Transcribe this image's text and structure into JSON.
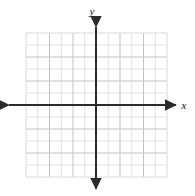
{
  "figure": {
    "name": "blank-cartesian-coordinate-grid",
    "background_color": "#ffffff",
    "width": 195,
    "height": 196
  },
  "axes": {
    "x_label": "x",
    "y_label": "y",
    "color": "#2b2b2b",
    "stroke_width": 2,
    "origin": {
      "x": 96,
      "y": 105
    },
    "x_start": {
      "x": 9,
      "y": 105
    },
    "x_end": {
      "x": 176,
      "y": 105
    },
    "y_start": {
      "x": 96,
      "y": 27
    },
    "y_end": {
      "x": 96,
      "y": 189
    },
    "arrowheads": [
      "left",
      "right",
      "up",
      "down"
    ],
    "x_label_pos": {
      "x": 184,
      "y": 109
    },
    "y_label_pos": {
      "x": 92,
      "y": 15
    }
  },
  "grid": {
    "left": 26,
    "top": 33,
    "right": 167,
    "bottom": 177,
    "columns": 12,
    "rows": 12,
    "cell_width": 11.75,
    "cell_height": 12.0,
    "minor_color": "#e2e2e4",
    "major_color": "#c3c3c7",
    "border_color": "#dadade",
    "major_every": 2,
    "tick_labels": [],
    "axis_numbers_shown": false
  },
  "chart_data": {
    "type": "scatter",
    "title": "",
    "xlabel": "x",
    "ylabel": "y",
    "series": [],
    "x": [],
    "values": [],
    "xlim": [
      -6,
      6
    ],
    "ylim": [
      -6,
      6
    ],
    "xticks": [],
    "yticks": [],
    "grid": true,
    "legend": "none",
    "note": "Empty coordinate plane with 12 by 12 unlabeled grid squares; no plotted data points."
  }
}
